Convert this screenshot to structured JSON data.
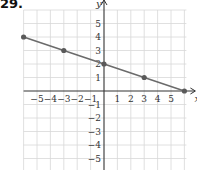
{
  "problem": {
    "label": "29."
  },
  "chart_data": {
    "type": "line",
    "title": "",
    "xlabel": "x",
    "ylabel": "y",
    "xlim": [
      -6,
      6
    ],
    "ylim": [
      -6,
      6
    ],
    "grid": true,
    "x_tick_labels": [
      "−5",
      "−4",
      "−3",
      "−2",
      "−1",
      "1",
      "2",
      "3",
      "4",
      "5"
    ],
    "y_tick_labels": [
      "5",
      "4",
      "3",
      "2",
      "1",
      "−1",
      "−2",
      "−3",
      "−4",
      "−5"
    ],
    "series": [
      {
        "name": "line",
        "x": [
          -6,
          -3,
          0,
          3,
          6
        ],
        "y": [
          4,
          3,
          2,
          1,
          0
        ],
        "marked_points": [
          [
            -6,
            4
          ],
          [
            -3,
            3
          ],
          [
            0,
            2
          ],
          [
            3,
            1
          ],
          [
            6,
            0
          ]
        ]
      }
    ],
    "colors": {
      "line": "#6b6b6b",
      "point": "#5a5a5a",
      "grid": "#d8d8d8",
      "axis": "#333333"
    }
  }
}
